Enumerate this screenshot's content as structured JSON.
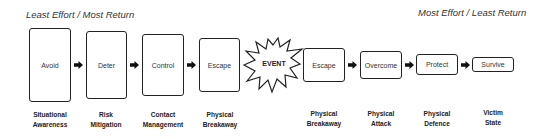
{
  "header": {
    "left_caption": "Least Effort / Most Return",
    "right_caption": "Most Effort / Least Return"
  },
  "stages": [
    {
      "label": "Avoid",
      "category": [
        "Situational",
        "Awareness"
      ]
    },
    {
      "label": "Deter",
      "category": [
        "Risk",
        "Mitigation"
      ]
    },
    {
      "label": "Control",
      "category": [
        "Contact",
        "Management"
      ]
    },
    {
      "label": "Escape",
      "category": [
        "Physical",
        "Breakaway"
      ]
    },
    {
      "label": "Escape",
      "category": [
        "Physical",
        "Breakaway"
      ]
    },
    {
      "label": "Overcome",
      "category": [
        "Physical",
        "Attack"
      ]
    },
    {
      "label": "Protect",
      "category": [
        "Physical",
        "Defence"
      ]
    },
    {
      "label": "Survive",
      "category": [
        "Victim",
        "State"
      ]
    }
  ],
  "event": {
    "label": "EVENT"
  },
  "icons": {
    "arrow": "right-arrow-icon",
    "event": "explosion-star-icon"
  }
}
